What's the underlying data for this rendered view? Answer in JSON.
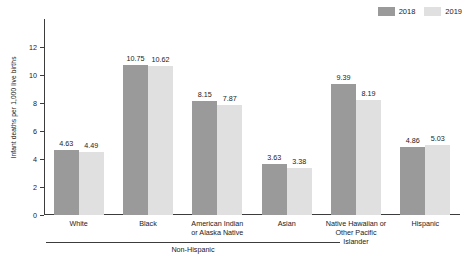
{
  "chart_data": {
    "type": "bar",
    "title": "",
    "xlabel": "",
    "ylabel": "Infant deaths per 1,000 live births",
    "ylim": [
      0,
      12
    ],
    "yticks": [
      0,
      2,
      4,
      6,
      8,
      10,
      12
    ],
    "ytick_labels": [
      "0",
      "2",
      "4",
      "6",
      "8",
      "10",
      "12"
    ],
    "grid": false,
    "legend_position": "top-right",
    "categories": [
      "White",
      "Black",
      "American Indian\nor Alaska Native",
      "Asian",
      "Native Hawaiian or\nOther Pacific Islander",
      "Hispanic"
    ],
    "category_lines": [
      [
        "White"
      ],
      [
        "Black"
      ],
      [
        "American Indian",
        "or Alaska Native"
      ],
      [
        "Asian"
      ],
      [
        "Native Hawaiian or",
        "Other Pacific Islander"
      ],
      [
        "Hispanic"
      ]
    ],
    "series": [
      {
        "name": "2018",
        "color": "#9a9a9a",
        "values": [
          4.63,
          10.75,
          8.15,
          3.63,
          9.39,
          4.86
        ],
        "labels": [
          "4.63",
          "10.75",
          "8.15",
          "3.63",
          "9.39",
          "4.86"
        ]
      },
      {
        "name": "2019",
        "color": "#e0e0e0",
        "values": [
          4.49,
          10.62,
          7.87,
          3.38,
          8.19,
          5.03
        ],
        "labels": [
          "4.49",
          "10.62",
          "7.87",
          "3.38",
          "8.19",
          "5.03"
        ]
      }
    ],
    "group_bracket": {
      "label": "Non-Hispanic",
      "spans_categories": [
        "White",
        "Black",
        "American Indian or Alaska Native",
        "Asian",
        "Native Hawaiian or Other Pacific Islander"
      ]
    }
  },
  "legend": {
    "entries": [
      {
        "label": "2018",
        "color": "#9a9a9a"
      },
      {
        "label": "2019",
        "color": "#e0e0e0"
      }
    ]
  },
  "colors": {
    "series_2018": "#9a9a9a",
    "series_2019": "#e0e0e0",
    "axis": "#3c3c3c",
    "text": "#1a1a1a",
    "background": "#ffffff"
  }
}
